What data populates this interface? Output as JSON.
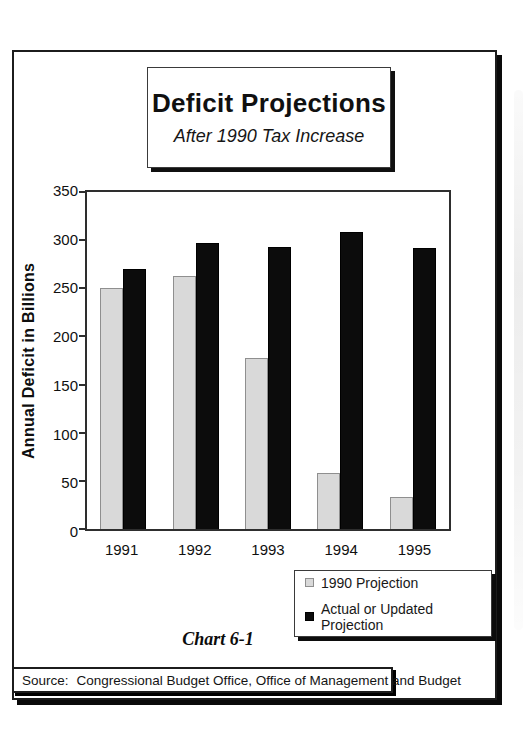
{
  "title_box": {
    "title": "Deficit Projections",
    "subtitle": "After 1990 Tax Increase"
  },
  "caption": "Chart 6-1",
  "source": {
    "label": "Source:",
    "text": "Congressional Budget Office, Office of Management and Budget"
  },
  "chart_data": {
    "type": "bar",
    "title": "Deficit Projections",
    "subtitle": "After 1990 Tax Increase",
    "categories": [
      "1991",
      "1992",
      "1993",
      "1994",
      "1995"
    ],
    "series": [
      {
        "name": "1990 Projection",
        "color": "#d9d9d9",
        "border_color": "#8f8f8f",
        "values": [
          250,
          263,
          178,
          58,
          33
        ]
      },
      {
        "name": "Actual or Updated Projection",
        "color": "#0c0c0c",
        "border_color": "#000000",
        "values": [
          270,
          297,
          293,
          308,
          292
        ]
      }
    ],
    "xlabel": "",
    "ylabel": "Annual Deficit in Billions",
    "ylim": [
      0,
      350
    ],
    "ytick_step": 50,
    "grid": false,
    "legend_position": "bottom-right"
  }
}
